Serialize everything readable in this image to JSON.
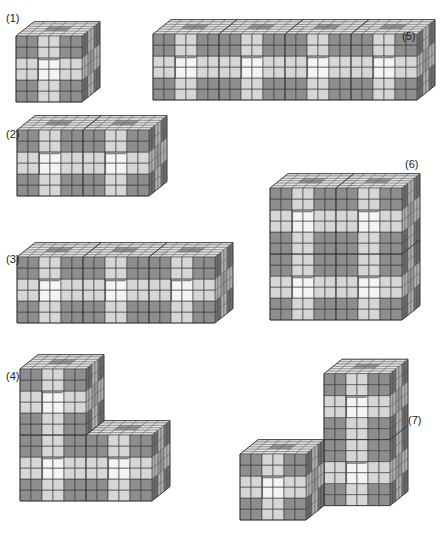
{
  "figure": {
    "width": 442,
    "height": 540,
    "unit": 11,
    "depth": {
      "dx": 3.0,
      "dy": -2.4
    },
    "colors": {
      "dark_front": "#8e8e8e",
      "light_front": "#d6d6d6",
      "dark_side": "#6f6f6f",
      "light_side": "#b0b0b0",
      "top": "#e2e2e2",
      "hole": "#f4f4f4",
      "hole_inner": "#9a9a9a",
      "grid": "#3a3a3a",
      "outline": "#333333"
    },
    "panels": [
      {
        "id": "1",
        "label": "(1)",
        "label_x": 6,
        "label_y": 12,
        "origin": [
          16,
          102
        ],
        "blocks": [
          [
            0,
            0,
            0
          ]
        ],
        "depth_blocks": 1
      },
      {
        "id": "2",
        "label": "(2)",
        "label_x": 6,
        "label_y": 128,
        "origin": [
          17,
          196
        ],
        "blocks": [
          [
            0,
            0,
            0
          ],
          [
            1,
            0,
            0
          ]
        ],
        "depth_blocks": 1
      },
      {
        "id": "3",
        "label": "(3)",
        "label_x": 6,
        "label_y": 253,
        "origin": [
          17,
          323
        ],
        "blocks": [
          [
            0,
            0,
            0
          ],
          [
            1,
            0,
            0
          ],
          [
            2,
            0,
            0
          ]
        ],
        "depth_blocks": 1
      },
      {
        "id": "4",
        "label": "(4)",
        "label_x": 6,
        "label_y": 370,
        "origin": [
          20,
          501
        ],
        "blocks": [
          [
            0,
            1,
            0
          ],
          [
            0,
            0,
            0
          ],
          [
            1,
            0,
            0
          ]
        ],
        "depth_blocks": 1
      },
      {
        "id": "5",
        "label": "(5)",
        "label_x": 402,
        "label_y": 30,
        "origin": [
          153,
          100
        ],
        "blocks": [
          [
            0,
            0,
            0
          ],
          [
            1,
            0,
            0
          ],
          [
            2,
            0,
            0
          ],
          [
            3,
            0,
            0
          ]
        ],
        "depth_blocks": 1
      },
      {
        "id": "6",
        "label": "(6)",
        "label_x": 405,
        "label_y": 158,
        "origin": [
          270,
          320
        ],
        "blocks": [
          [
            0,
            1,
            0
          ],
          [
            1,
            1,
            0
          ],
          [
            0,
            0,
            0
          ],
          [
            1,
            0,
            0
          ]
        ],
        "depth_blocks": 1
      },
      {
        "id": "7",
        "label": "(7)",
        "label_x": 408,
        "label_y": 414,
        "origin": [
          240,
          520
        ],
        "blocks": [
          [
            1,
            1,
            1
          ],
          [
            1,
            0,
            1
          ],
          [
            0,
            0,
            0
          ]
        ],
        "depth_blocks": 1
      }
    ]
  }
}
